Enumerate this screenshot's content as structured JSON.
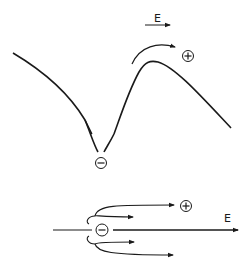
{
  "diagram": {
    "top_panel": {
      "field_label": "E",
      "positive_charge_symbol": "+",
      "negative_charge_symbol": "−",
      "description": "Potential curve with a well at the negative charge; a particle hops over the barrier toward the positive charge along the field direction"
    },
    "bottom_panel": {
      "field_label": "E",
      "positive_charge_symbol": "+",
      "negative_charge_symbol": "−",
      "description": "Field line through a negative charge with curved escape paths, mostly deflected in the field direction toward the positive charge"
    },
    "colors": {
      "stroke": "#1a1a1a",
      "background": "#ffffff"
    }
  }
}
